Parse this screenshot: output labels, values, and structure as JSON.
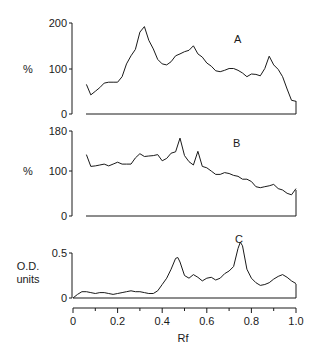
{
  "chart_data": [
    {
      "type": "line",
      "panel": "A",
      "title": "A",
      "xlabel": "Rf",
      "ylabel": "%",
      "yticks": [
        "0",
        "100",
        "200"
      ],
      "ylim": [
        0,
        200
      ],
      "xlim": [
        0,
        1.0
      ],
      "grid": false,
      "x": [
        0.06,
        0.08,
        0.1,
        0.12,
        0.14,
        0.16,
        0.18,
        0.2,
        0.22,
        0.24,
        0.26,
        0.28,
        0.3,
        0.32,
        0.34,
        0.36,
        0.38,
        0.4,
        0.42,
        0.44,
        0.46,
        0.48,
        0.5,
        0.52,
        0.54,
        0.56,
        0.58,
        0.6,
        0.62,
        0.64,
        0.66,
        0.68,
        0.7,
        0.72,
        0.74,
        0.76,
        0.78,
        0.8,
        0.82,
        0.84,
        0.86,
        0.88,
        0.9,
        0.92,
        0.94,
        0.96,
        0.98,
        1.0
      ],
      "values": [
        65,
        42,
        50,
        58,
        68,
        70,
        70,
        70,
        82,
        110,
        128,
        142,
        180,
        192,
        162,
        143,
        120,
        110,
        108,
        115,
        128,
        132,
        137,
        140,
        150,
        132,
        125,
        112,
        105,
        95,
        93,
        96,
        100,
        100,
        96,
        90,
        82,
        88,
        87,
        84,
        100,
        127,
        108,
        98,
        82,
        55,
        30,
        28
      ]
    },
    {
      "type": "line",
      "panel": "B",
      "title": "B",
      "xlabel": "Rf",
      "ylabel": "%",
      "yticks": [
        "0",
        "100",
        "180"
      ],
      "ylim": [
        0,
        180
      ],
      "xlim": [
        0,
        1.0
      ],
      "grid": false,
      "x": [
        0.06,
        0.08,
        0.1,
        0.12,
        0.14,
        0.16,
        0.18,
        0.2,
        0.22,
        0.24,
        0.26,
        0.28,
        0.3,
        0.32,
        0.34,
        0.36,
        0.38,
        0.4,
        0.42,
        0.44,
        0.46,
        0.48,
        0.5,
        0.52,
        0.54,
        0.56,
        0.58,
        0.6,
        0.62,
        0.64,
        0.66,
        0.68,
        0.7,
        0.72,
        0.74,
        0.76,
        0.78,
        0.8,
        0.82,
        0.84,
        0.86,
        0.88,
        0.9,
        0.92,
        0.94,
        0.96,
        0.98,
        1.0
      ],
      "values": [
        130,
        105,
        106,
        108,
        110,
        106,
        110,
        114,
        110,
        110,
        110,
        123,
        132,
        126,
        127,
        128,
        130,
        117,
        122,
        133,
        136,
        165,
        128,
        115,
        108,
        137,
        105,
        102,
        95,
        88,
        88,
        92,
        90,
        86,
        84,
        78,
        78,
        73,
        62,
        60,
        62,
        64,
        67,
        58,
        55,
        48,
        45,
        58
      ]
    },
    {
      "type": "line",
      "panel": "C",
      "title": "C",
      "xlabel": "Rf",
      "ylabel": "O.D. units",
      "yticks": [
        "0",
        "0.5"
      ],
      "ylim": [
        0,
        0.65
      ],
      "xlim": [
        0,
        1.0
      ],
      "xticks": [
        "0",
        "0.2",
        "0.4",
        "0.6",
        "0.8",
        "1.0"
      ],
      "grid": false,
      "x": [
        0.0,
        0.02,
        0.04,
        0.06,
        0.08,
        0.1,
        0.12,
        0.14,
        0.16,
        0.18,
        0.2,
        0.22,
        0.24,
        0.26,
        0.28,
        0.3,
        0.32,
        0.34,
        0.36,
        0.38,
        0.4,
        0.42,
        0.44,
        0.46,
        0.47,
        0.48,
        0.5,
        0.52,
        0.54,
        0.56,
        0.58,
        0.6,
        0.62,
        0.64,
        0.66,
        0.68,
        0.7,
        0.72,
        0.74,
        0.75,
        0.76,
        0.78,
        0.8,
        0.82,
        0.84,
        0.86,
        0.88,
        0.9,
        0.92,
        0.94,
        0.96,
        0.98,
        1.0
      ],
      "values": [
        0.0,
        0.04,
        0.07,
        0.07,
        0.06,
        0.05,
        0.06,
        0.06,
        0.05,
        0.04,
        0.05,
        0.06,
        0.07,
        0.08,
        0.07,
        0.07,
        0.06,
        0.05,
        0.05,
        0.08,
        0.15,
        0.22,
        0.32,
        0.44,
        0.45,
        0.4,
        0.25,
        0.22,
        0.26,
        0.23,
        0.19,
        0.22,
        0.23,
        0.2,
        0.22,
        0.27,
        0.3,
        0.35,
        0.55,
        0.62,
        0.58,
        0.32,
        0.22,
        0.17,
        0.14,
        0.15,
        0.17,
        0.21,
        0.24,
        0.26,
        0.23,
        0.19,
        0.16
      ]
    }
  ],
  "labels": {
    "panel_a": "A",
    "panel_b": "B",
    "panel_c": "C",
    "y_a": "%",
    "y_b": "%",
    "y_c_line1": "O.D.",
    "y_c_line2": "units",
    "x_label": "Rf",
    "a_ticks": [
      "200",
      "100",
      "0"
    ],
    "b_ticks": [
      "180",
      "100",
      "0"
    ],
    "c_ticks": [
      "0.5",
      "0"
    ],
    "x_ticks": [
      "0",
      "0.2",
      "0.4",
      "0.6",
      "0.8",
      "1.0"
    ]
  },
  "colors": {
    "ink": "#1a1a1a",
    "background": "#ffffff"
  }
}
